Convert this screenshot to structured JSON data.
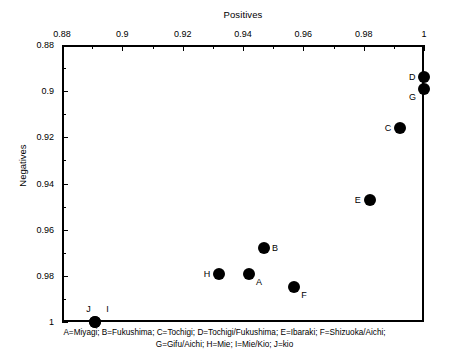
{
  "chart_data": {
    "type": "scatter",
    "title": "",
    "xlabel": "Positives",
    "ylabel": "Negatives",
    "xlim": [
      0.88,
      1.0
    ],
    "ylim": [
      0.88,
      1.0
    ],
    "y_axis_inverted": true,
    "x_axis_position": "top",
    "grid": false,
    "legend_position": "below-plot",
    "xticks": [
      "0.88",
      "0.9",
      "0.92",
      "0.94",
      "0.96",
      "0.98",
      "1"
    ],
    "xtick_values": [
      0.88,
      0.9,
      0.92,
      0.94,
      0.96,
      0.98,
      1.0
    ],
    "yticks": [
      "0.88",
      "0.9",
      "0.92",
      "0.94",
      "0.96",
      "0.98",
      "1"
    ],
    "ytick_values": [
      0.88,
      0.9,
      0.92,
      0.94,
      0.96,
      0.98,
      1.0
    ],
    "marker_color": "#000000",
    "points": [
      {
        "label": "A",
        "x": 0.942,
        "y": 0.979,
        "label_pos": "bottom-right"
      },
      {
        "label": "B",
        "x": 0.947,
        "y": 0.968,
        "label_pos": "right"
      },
      {
        "label": "C",
        "x": 0.992,
        "y": 0.916,
        "label_pos": "left"
      },
      {
        "label": "D",
        "x": 1.0,
        "y": 0.894,
        "label_pos": "left"
      },
      {
        "label": "E",
        "x": 0.982,
        "y": 0.947,
        "label_pos": "left"
      },
      {
        "label": "F",
        "x": 0.957,
        "y": 0.985,
        "label_pos": "bottom-right"
      },
      {
        "label": "G",
        "x": 1.0,
        "y": 0.899,
        "label_pos": "bottom-left"
      },
      {
        "label": "H",
        "x": 0.932,
        "y": 0.979,
        "label_pos": "left"
      },
      {
        "label": "I",
        "x": 0.891,
        "y": 1.0,
        "label_pos": "top-right"
      },
      {
        "label": "J",
        "x": 0.891,
        "y": 1.0,
        "label_pos": "top"
      }
    ],
    "legend": {
      "line1": "A=Miyagi; B=Fukushima; C=Tochigi; D=Tochigi/Fukushima; E=Ibaraki; F=Shizuoka/Aichi;",
      "line2": "G=Gifu/Aichi; H=Mie; I=Mie/Kio; J=kio"
    }
  }
}
